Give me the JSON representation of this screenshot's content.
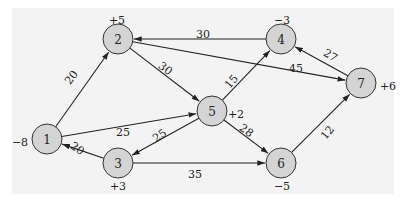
{
  "diagram": {
    "type": "network-flow",
    "background_color": "#f3f3f3",
    "node_fill": "#d4d4d4",
    "nodes": [
      {
        "id": "1",
        "label": "1",
        "supply": "-8",
        "x": 47,
        "y": 139,
        "supply_pos": [
          20,
          143
        ]
      },
      {
        "id": "2",
        "label": "2",
        "supply": "+5",
        "x": 118,
        "y": 39,
        "supply_pos": [
          117,
          21
        ]
      },
      {
        "id": "3",
        "label": "3",
        "supply": "+3",
        "x": 118,
        "y": 163,
        "supply_pos": [
          118,
          187
        ]
      },
      {
        "id": "4",
        "label": "4",
        "supply": "-3",
        "x": 281,
        "y": 39,
        "supply_pos": [
          282,
          21
        ]
      },
      {
        "id": "5",
        "label": "5",
        "supply": "+2",
        "x": 212,
        "y": 111,
        "supply_pos": [
          236,
          115
        ]
      },
      {
        "id": "6",
        "label": "6",
        "supply": "-5",
        "x": 281,
        "y": 163,
        "supply_pos": [
          282,
          187
        ]
      },
      {
        "id": "7",
        "label": "7",
        "supply": "+6",
        "x": 361,
        "y": 83,
        "supply_pos": [
          388,
          87
        ]
      }
    ],
    "edges": [
      {
        "from": "1",
        "to": "2",
        "cost": "20",
        "label_pos": [
          72,
          78
        ],
        "rotate": -52
      },
      {
        "from": "1",
        "to": "5",
        "cost": "25",
        "label_pos": [
          123,
          133
        ],
        "rotate": 0
      },
      {
        "from": "2",
        "to": "5",
        "cost": "30",
        "label_pos": [
          165,
          69
        ],
        "rotate": 37
      },
      {
        "from": "2",
        "to": "7",
        "cost": "45",
        "label_pos": [
          296,
          69
        ],
        "rotate": 0
      },
      {
        "from": "4",
        "to": "2",
        "cost": "30",
        "label_pos": [
          203,
          35
        ],
        "rotate": 0
      },
      {
        "from": "5",
        "to": "4",
        "cost": "15",
        "label_pos": [
          232,
          82
        ],
        "rotate": -50
      },
      {
        "from": "5",
        "to": "3",
        "cost": "25",
        "label_pos": [
          160,
          136
        ],
        "rotate": -35
      },
      {
        "from": "5",
        "to": "6",
        "cost": "28",
        "label_pos": [
          246,
          131
        ],
        "rotate": 37
      },
      {
        "from": "3",
        "to": "1",
        "cost": "20",
        "label_pos": [
          77,
          149
        ],
        "rotate": 35
      },
      {
        "from": "3",
        "to": "6",
        "cost": "35",
        "label_pos": [
          195,
          175
        ],
        "rotate": 0
      },
      {
        "from": "7",
        "to": "4",
        "cost": "27",
        "label_pos": [
          330,
          56
        ],
        "rotate": 32
      },
      {
        "from": "6",
        "to": "7",
        "cost": "12",
        "label_pos": [
          328,
          133
        ],
        "rotate": -50
      }
    ]
  }
}
